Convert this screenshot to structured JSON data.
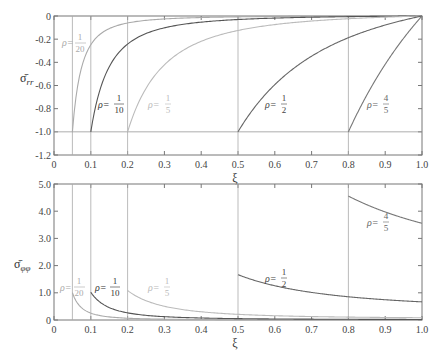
{
  "chart_data": [
    {
      "type": "line",
      "title": "",
      "xlabel": "ξ",
      "ylabel": "σ̄_rr",
      "xlim": [
        0,
        1.0
      ],
      "ylim": [
        -1.2,
        0
      ],
      "grid": false,
      "xticks": [
        "0",
        "0.1",
        "0.2",
        "0.3",
        "0.4",
        "0.5",
        "0.6",
        "0.7",
        "0.8",
        "0.9",
        "1.0"
      ],
      "yticks": [
        "0",
        "-0.2",
        "-0.4",
        "-0.6",
        "-0.8",
        "-1.0",
        "-1.2"
      ],
      "series": [
        {
          "name": "ρ=1/20",
          "rho": 0.05,
          "color": "#aaaaaa",
          "x": [
            0.05,
            0.1,
            0.2,
            0.3,
            0.5,
            0.7,
            1.0
          ],
          "values": [
            -1.0,
            -0.248,
            -0.06,
            -0.025,
            -0.0075,
            -0.0026,
            0
          ]
        },
        {
          "name": "ρ=1/10",
          "rho": 0.1,
          "color": "#555555",
          "x": [
            0.1,
            0.15,
            0.2,
            0.3,
            0.5,
            0.7,
            1.0
          ],
          "values": [
            -1.0,
            -0.434,
            -0.242,
            -0.101,
            -0.0323,
            -0.0104,
            0
          ]
        },
        {
          "name": "ρ=1/5",
          "rho": 0.2,
          "color": "#bbbbbb",
          "x": [
            0.2,
            0.3,
            0.4,
            0.5,
            0.7,
            0.9,
            1.0
          ],
          "values": [
            -1.0,
            -0.424,
            -0.219,
            -0.175,
            -0.043,
            -0.0098,
            0
          ]
        },
        {
          "name": "ρ=1/2",
          "rho": 0.5,
          "color": "#666666",
          "x": [
            0.5,
            0.6,
            0.7,
            0.8,
            0.9,
            1.0
          ],
          "values": [
            -1.0,
            -0.593,
            -0.347,
            -0.187,
            -0.077,
            0
          ]
        },
        {
          "name": "ρ=4/5",
          "rho": 0.8,
          "color": "#777777",
          "x": [
            0.8,
            0.85,
            0.9,
            0.95,
            1.0
          ],
          "values": [
            -1.0,
            -0.683,
            -0.417,
            -0.193,
            0
          ]
        }
      ],
      "annotations": [
        "ρ=1/20",
        "ρ=1/10",
        "ρ=1/5",
        "ρ=1/2",
        "ρ=4/5"
      ],
      "reference_lines": {
        "horizontal": [
          -1.0
        ],
        "vertical": [
          0.05,
          0.1,
          0.2,
          0.5,
          0.8
        ]
      }
    },
    {
      "type": "line",
      "title": "",
      "xlabel": "ξ",
      "ylabel": "σ̄_φφ",
      "xlim": [
        0,
        1.0
      ],
      "ylim": [
        0,
        5.0
      ],
      "grid": false,
      "xticks": [
        "0",
        "0.1",
        "0.2",
        "0.3",
        "0.4",
        "0.5",
        "0.6",
        "0.7",
        "0.8",
        "0.9",
        "1.0"
      ],
      "yticks": [
        "0",
        "1.0",
        "2.0",
        "3.0",
        "4.0",
        "5.0"
      ],
      "series": [
        {
          "name": "ρ=1/20",
          "rho": 0.05,
          "color": "#aaaaaa",
          "x": [
            0.05,
            0.1,
            0.2,
            0.5,
            1.0
          ],
          "values": [
            1.005,
            0.253,
            0.065,
            0.013,
            0.005
          ]
        },
        {
          "name": "ρ=1/10",
          "rho": 0.1,
          "color": "#555555",
          "x": [
            0.1,
            0.2,
            0.3,
            0.5,
            1.0
          ],
          "values": [
            1.02,
            0.263,
            0.122,
            0.052,
            0.02
          ]
        },
        {
          "name": "ρ=1/5",
          "rho": 0.2,
          "color": "#bbbbbb",
          "x": [
            0.2,
            0.3,
            0.5,
            0.7,
            1.0
          ],
          "values": [
            1.083,
            0.507,
            0.242,
            0.127,
            0.083
          ]
        },
        {
          "name": "ρ=1/2",
          "rho": 0.5,
          "color": "#666666",
          "x": [
            0.5,
            0.6,
            0.7,
            0.8,
            0.9,
            1.0
          ],
          "values": [
            1.667,
            1.259,
            1.014,
            0.854,
            0.745,
            0.667
          ]
        },
        {
          "name": "ρ=4/5",
          "rho": 0.8,
          "color": "#777777",
          "x": [
            0.8,
            0.85,
            0.9,
            0.95,
            1.0
          ],
          "values": [
            4.556,
            4.238,
            3.972,
            3.749,
            3.556
          ]
        }
      ],
      "annotations": [
        "ρ=1/20",
        "ρ=1/10",
        "ρ=1/5",
        "ρ=1/2",
        "ρ=4/5"
      ],
      "reference_lines": {
        "vertical": [
          0.05,
          0.1,
          0.2,
          0.5,
          0.8
        ]
      }
    }
  ],
  "top_plot": {
    "ylabel": "σ̄",
    "ylabel_sub": "rr",
    "xlabel": "ξ",
    "yticks": [
      "0",
      "-0.2",
      "-0.4",
      "-0.6",
      "-0.8",
      "-1.0",
      "-1.2"
    ],
    "xticks": [
      "0",
      "0.1",
      "0.2",
      "0.3",
      "0.4",
      "0.5",
      "0.6",
      "0.7",
      "0.8",
      "0.9",
      "1.0"
    ]
  },
  "bottom_plot": {
    "ylabel": "σ̄",
    "ylabel_sub": "φφ",
    "xlabel": "ξ",
    "yticks": [
      "0",
      "1.0",
      "2.0",
      "3.0",
      "4.0",
      "5.0"
    ],
    "xticks": [
      "0",
      "0.1",
      "0.2",
      "0.3",
      "0.4",
      "0.5",
      "0.6",
      "0.7",
      "0.8",
      "0.9",
      "1.0"
    ]
  },
  "labels": {
    "rho": "ρ=",
    "r20_num": "1",
    "r20_den": "20",
    "r10_num": "1",
    "r10_den": "10",
    "r5_num": "1",
    "r5_den": "5",
    "r2_num": "1",
    "r2_den": "2",
    "r45_num": "4",
    "r45_den": "5"
  }
}
